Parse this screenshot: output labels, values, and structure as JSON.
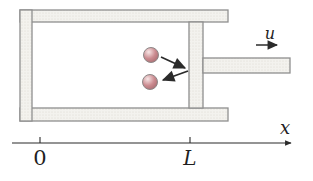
{
  "figure": {
    "piston": {
      "velocity_label": "u"
    },
    "axis": {
      "label": "x",
      "ticks": [
        {
          "label": "0"
        },
        {
          "label": "L"
        }
      ]
    },
    "molecules": {
      "count": 2
    },
    "colors": {
      "wall_fill": "#f3f2ee",
      "wall_dot": "#dbd9d1",
      "wall_stroke": "#8f8f8f",
      "molecule_body": "#cb8b90",
      "molecule_edge": "#a76b70",
      "molecule_highlight": "#f7e6e6",
      "molecule_stroke": "#8d8888",
      "line_color": "#2b2b2b",
      "text_color": "#1f1f1f"
    }
  }
}
